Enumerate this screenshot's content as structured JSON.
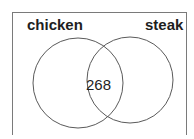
{
  "diagram": {
    "type": "venn",
    "sets": [
      {
        "label": "chicken"
      },
      {
        "label": "steak"
      }
    ],
    "intersection": {
      "value": "268"
    }
  },
  "colors": {
    "stroke": "#5a5a5a",
    "text": "#1e1e1e",
    "background": "#ffffff"
  }
}
